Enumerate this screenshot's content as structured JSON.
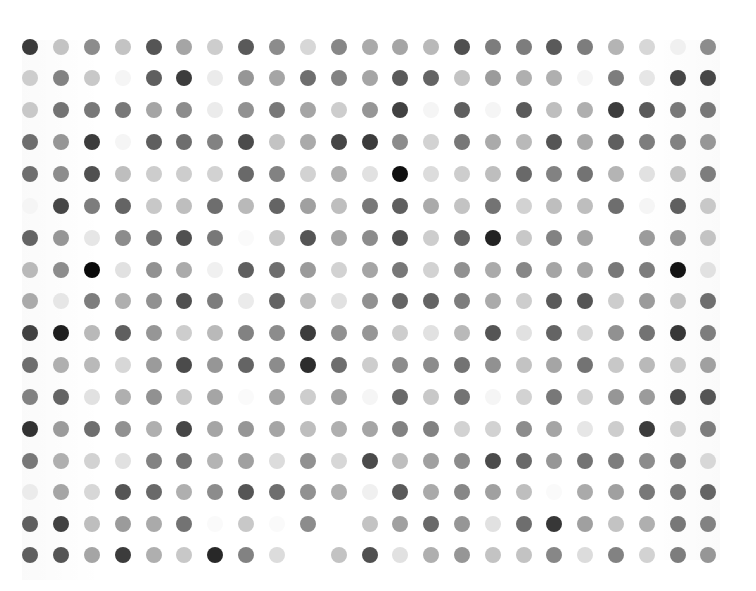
{
  "artwork": {
    "type": "dot-grid",
    "columns": 23,
    "rows": 17,
    "dot_diameter_px": 16,
    "background": "#ffffff",
    "column_x": [
      30,
      61,
      92,
      123,
      154,
      184,
      215,
      246,
      277,
      308,
      339,
      370,
      400,
      431,
      462,
      493,
      524,
      554,
      585,
      616,
      647,
      678,
      708
    ],
    "row_y": [
      47,
      78,
      110,
      142,
      174,
      206,
      238,
      270,
      301,
      333,
      365,
      397,
      429,
      461,
      492,
      524,
      555
    ],
    "gray_levels": [
      [
        58,
        195,
        140,
        195,
        85,
        165,
        205,
        90,
        140,
        215,
        135,
        170,
        165,
        185,
        80,
        125,
        125,
        90,
        125,
        180,
        215,
        240,
        140
      ],
      [
        205,
        130,
        200,
        245,
        95,
        60,
        235,
        150,
        165,
        110,
        130,
        165,
        90,
        100,
        195,
        155,
        175,
        175,
        245,
        125,
        230,
        70,
        70
      ],
      [
        200,
        115,
        120,
        120,
        165,
        140,
        235,
        145,
        120,
        165,
        205,
        150,
        65,
        245,
        95,
        245,
        90,
        190,
        175,
        60,
        90,
        120,
        120
      ],
      [
        110,
        150,
        60,
        245,
        95,
        110,
        130,
        75,
        195,
        170,
        70,
        60,
        140,
        210,
        120,
        170,
        185,
        85,
        170,
        95,
        125,
        130,
        150
      ],
      [
        110,
        140,
        80,
        190,
        205,
        205,
        210,
        105,
        130,
        210,
        175,
        225,
        15,
        220,
        205,
        190,
        105,
        130,
        115,
        180,
        225,
        195,
        125
      ],
      [
        245,
        70,
        125,
        100,
        200,
        190,
        110,
        185,
        100,
        160,
        190,
        120,
        95,
        170,
        195,
        115,
        210,
        190,
        190,
        110,
        245,
        95,
        200
      ],
      [
        100,
        150,
        230,
        140,
        115,
        80,
        120,
        250,
        200,
        85,
        165,
        140,
        80,
        205,
        100,
        35,
        200,
        130,
        165,
        255,
        155,
        150,
        195
      ],
      [
        185,
        140,
        10,
        225,
        145,
        170,
        240,
        95,
        110,
        155,
        210,
        165,
        120,
        210,
        145,
        170,
        135,
        165,
        165,
        120,
        125,
        20,
        225
      ],
      [
        170,
        230,
        125,
        175,
        145,
        80,
        125,
        235,
        100,
        190,
        225,
        145,
        100,
        100,
        125,
        170,
        205,
        90,
        85,
        205,
        155,
        195,
        110
      ],
      [
        65,
        30,
        185,
        95,
        150,
        205,
        185,
        130,
        140,
        60,
        145,
        150,
        205,
        225,
        185,
        85,
        225,
        100,
        215,
        145,
        115,
        55,
        125
      ],
      [
        110,
        175,
        185,
        215,
        155,
        75,
        150,
        100,
        140,
        45,
        110,
        205,
        140,
        140,
        115,
        145,
        195,
        165,
        115,
        200,
        185,
        200,
        160
      ],
      [
        130,
        100,
        225,
        175,
        145,
        200,
        165,
        250,
        165,
        205,
        160,
        245,
        105,
        200,
        115,
        245,
        210,
        120,
        210,
        150,
        155,
        75,
        85
      ],
      [
        50,
        155,
        110,
        145,
        175,
        70,
        165,
        150,
        165,
        190,
        175,
        165,
        130,
        130,
        210,
        210,
        140,
        165,
        230,
        205,
        60,
        205,
        125
      ],
      [
        120,
        175,
        210,
        225,
        130,
        115,
        180,
        160,
        220,
        145,
        215,
        75,
        190,
        160,
        140,
        75,
        105,
        150,
        115,
        125,
        140,
        125,
        215
      ],
      [
        235,
        165,
        215,
        85,
        105,
        175,
        140,
        85,
        110,
        145,
        175,
        240,
        90,
        170,
        135,
        160,
        190,
        250,
        170,
        160,
        120,
        120,
        100
      ],
      [
        95,
        65,
        190,
        155,
        170,
        115,
        250,
        200,
        250,
        140,
        255,
        195,
        160,
        105,
        150,
        225,
        110,
        55,
        160,
        195,
        175,
        120,
        130
      ],
      [
        95,
        85,
        165,
        60,
        175,
        200,
        40,
        130,
        220,
        255,
        195,
        80,
        225,
        175,
        150,
        195,
        195,
        135,
        220,
        130,
        210,
        125,
        150
      ]
    ]
  }
}
